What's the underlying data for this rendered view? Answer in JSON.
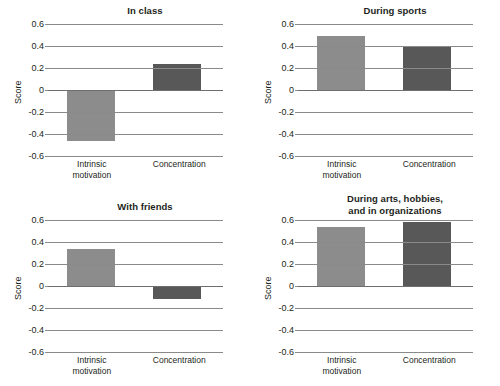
{
  "figure": {
    "axis_label": "Score",
    "categories": [
      "Intrinsic motivation",
      "Concentration"
    ],
    "category_lines": [
      [
        "Intrinsic",
        "motivation"
      ],
      [
        "Concentration"
      ]
    ],
    "yticks": [
      "0.6",
      "0.4",
      "0.2",
      "0",
      "-0.2",
      "-0.4",
      "-0.6"
    ],
    "ytick_values": [
      0.6,
      0.4,
      0.2,
      0,
      -0.2,
      -0.4,
      -0.6
    ],
    "ylim": [
      -0.6,
      0.6
    ],
    "colors": {
      "intrinsic_motivation_bar": "#8c8c8c",
      "concentration_bar": "#585858",
      "gridline": "#8a8a8a",
      "text": "#231f20",
      "background": "#ffffff"
    },
    "panels": [
      {
        "id": "in-class",
        "title": "In class",
        "title_lines": [
          "In class"
        ],
        "values": [
          -0.46,
          0.24
        ]
      },
      {
        "id": "during-sports",
        "title": "During sports",
        "title_lines": [
          "During sports"
        ],
        "values": [
          0.49,
          0.39
        ]
      },
      {
        "id": "with-friends",
        "title": "With friends",
        "title_lines": [
          "With friends"
        ],
        "values": [
          0.34,
          -0.12
        ]
      },
      {
        "id": "during-arts-hobbies-organizations",
        "title": "During arts, hobbies, and in organizations",
        "title_lines": [
          "During arts, hobbies,",
          "and in organizations"
        ],
        "values": [
          0.54,
          0.58
        ]
      }
    ]
  },
  "chart_data": [
    {
      "type": "bar",
      "title": "In class",
      "categories": [
        "Intrinsic motivation",
        "Concentration"
      ],
      "values": [
        -0.46,
        0.24
      ],
      "xlabel": "",
      "ylabel": "Score",
      "ylim": [
        -0.6,
        0.6
      ],
      "yticks": [
        -0.6,
        -0.4,
        -0.2,
        0,
        0.2,
        0.4,
        0.6
      ],
      "grid": true,
      "legend": "none",
      "bar_colors": [
        "#8c8c8c",
        "#585858"
      ]
    },
    {
      "type": "bar",
      "title": "During sports",
      "categories": [
        "Intrinsic motivation",
        "Concentration"
      ],
      "values": [
        0.49,
        0.39
      ],
      "xlabel": "",
      "ylabel": "Score",
      "ylim": [
        -0.6,
        0.6
      ],
      "yticks": [
        -0.6,
        -0.4,
        -0.2,
        0,
        0.2,
        0.4,
        0.6
      ],
      "grid": true,
      "legend": "none",
      "bar_colors": [
        "#8c8c8c",
        "#585858"
      ]
    },
    {
      "type": "bar",
      "title": "With friends",
      "categories": [
        "Intrinsic motivation",
        "Concentration"
      ],
      "values": [
        0.34,
        -0.12
      ],
      "xlabel": "",
      "ylabel": "Score",
      "ylim": [
        -0.6,
        0.6
      ],
      "yticks": [
        -0.6,
        -0.4,
        -0.2,
        0,
        0.2,
        0.4,
        0.6
      ],
      "grid": true,
      "legend": "none",
      "bar_colors": [
        "#8c8c8c",
        "#585858"
      ]
    },
    {
      "type": "bar",
      "title": "During arts, hobbies, and in organizations",
      "categories": [
        "Intrinsic motivation",
        "Concentration"
      ],
      "values": [
        0.54,
        0.58
      ],
      "xlabel": "",
      "ylabel": "Score",
      "ylim": [
        -0.6,
        0.6
      ],
      "yticks": [
        -0.6,
        -0.4,
        -0.2,
        0,
        0.2,
        0.4,
        0.6
      ],
      "grid": true,
      "legend": "none",
      "bar_colors": [
        "#8c8c8c",
        "#585858"
      ]
    }
  ]
}
